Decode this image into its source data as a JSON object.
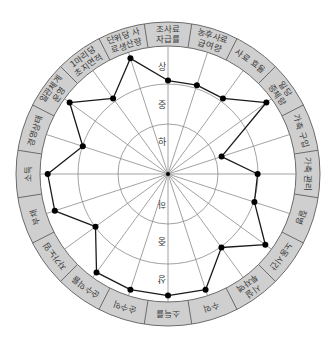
{
  "chart_data": {
    "type": "radar",
    "title": "",
    "levels": [
      "하",
      "중",
      "상"
    ],
    "level_labels_top": [
      "상",
      "중",
      "하"
    ],
    "level_labels_bottom": [
      "하",
      "중",
      "상"
    ],
    "categories": [
      "조사료 자급률",
      "농후사료 급여량",
      "사료 효율",
      "일당 증체량",
      "가축 구입",
      "가축 관리",
      "질병",
      "노동시간",
      "시설 투자액",
      "수익",
      "소득률",
      "순수익",
      "순수익률",
      "자가노임",
      "부채",
      "소득",
      "경영상태",
      "일관체계 운영",
      "1마리당 초지면적",
      "단위당 사료생산량"
    ],
    "label_lines": [
      [
        "조사료",
        "자급률"
      ],
      [
        "농후사료",
        "급여량"
      ],
      [
        "사료 효율"
      ],
      [
        "일당",
        "증체량"
      ],
      [
        "가축 구입"
      ],
      [
        "가축 관리"
      ],
      [
        "질병"
      ],
      [
        "노동시간"
      ],
      [
        "시설",
        "투자액"
      ],
      [
        "수익"
      ],
      [
        "소득률"
      ],
      [
        "순수익"
      ],
      [
        "순수익률"
      ],
      [
        "자가노임"
      ],
      [
        "부채"
      ],
      [
        "소득"
      ],
      [
        "경영상태"
      ],
      [
        "일관체계",
        "운영"
      ],
      [
        "1마리당",
        "초지면적"
      ],
      [
        "단위당 사",
        "료생산량"
      ]
    ],
    "values": [
      0.73,
      0.73,
      0.73,
      0.95,
      0.44,
      0.7,
      0.71,
      0.94,
      0.71,
      0.95,
      0.95,
      0.95,
      0.95,
      0.7,
      0.93,
      0.94,
      0.7,
      0.95,
      0.73,
      0.95
    ],
    "value_scale_note": "1.0 = 상 circle; 0.70 ≈ 중; 0.39 ≈ 하",
    "grid": true,
    "legend": null
  },
  "colors": {
    "band_fill": "#cfcfcf",
    "band_stroke": "#6b6b6b",
    "grid_stroke": "#8a8a8a",
    "series_stroke": "#1a1a1a",
    "point_fill": "#000000",
    "label_text": "#3a3a3a"
  }
}
